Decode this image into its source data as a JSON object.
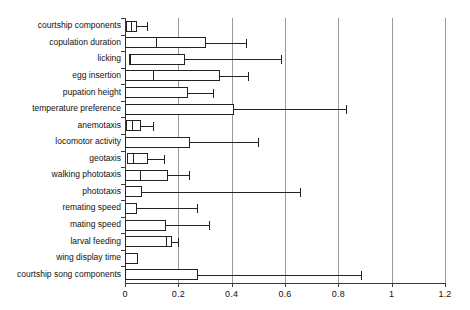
{
  "chart_data": {
    "type": "bar",
    "title": "",
    "subtitle": "",
    "xlabel": "",
    "ylabel": "",
    "xlim": [
      0,
      1.2
    ],
    "grid": true,
    "legend": "none",
    "orientation": "horizontal",
    "plot_style": "box-and-whisker",
    "xticks": [
      0,
      0.2,
      0.4,
      0.6,
      0.8,
      1,
      1.2
    ],
    "xtick_labels": [
      "0",
      "0.2",
      "0.4",
      "0.6",
      "0.8",
      "1",
      "1.2"
    ],
    "categories": [
      "courtship components",
      "copulation duration",
      "licking",
      "egg insertion",
      "pupation height",
      "temperature preference",
      "anemotaxis",
      "locomotor activity",
      "geotaxis",
      "walking phototaxis",
      "phototaxis",
      "remating speed",
      "mating speed",
      "larval feeding",
      "wing display time",
      "courtship song components"
    ],
    "series": [
      {
        "name": "box lower (q1)",
        "values": [
          0.005,
          0.0,
          0.015,
          0.0,
          0.0,
          0.0,
          0.005,
          0.0,
          0.008,
          0.0,
          0.0,
          0.0,
          0.0,
          0.0,
          0.0,
          0.0
        ]
      },
      {
        "name": "median",
        "values": [
          0.022,
          0.115,
          0.018,
          0.105,
          0.0,
          0.0,
          0.028,
          0.0,
          0.03,
          0.055,
          0.0,
          0.0,
          0.0,
          0.155,
          0.0,
          0.0
        ]
      },
      {
        "name": "box upper (q3)",
        "values": [
          0.045,
          0.305,
          0.225,
          0.355,
          0.235,
          0.41,
          0.06,
          0.245,
          0.085,
          0.16,
          0.065,
          0.045,
          0.155,
          0.175,
          0.048,
          0.275
        ]
      },
      {
        "name": "whisker max",
        "values": [
          0.082,
          0.455,
          0.585,
          0.46,
          0.33,
          0.83,
          0.105,
          0.5,
          0.145,
          0.24,
          0.655,
          0.27,
          0.315,
          0.2,
          0.048,
          0.885
        ]
      }
    ],
    "rows": [
      {
        "label": "courtship components",
        "q1": 0.005,
        "median": 0.022,
        "q3": 0.045,
        "whisker": 0.082
      },
      {
        "label": "copulation duration",
        "q1": 0.0,
        "median": 0.115,
        "q3": 0.305,
        "whisker": 0.455
      },
      {
        "label": "licking",
        "q1": 0.015,
        "median": 0.018,
        "q3": 0.225,
        "whisker": 0.585
      },
      {
        "label": "egg insertion",
        "q1": 0.0,
        "median": 0.105,
        "q3": 0.355,
        "whisker": 0.46
      },
      {
        "label": "pupation height",
        "q1": 0.0,
        "median": null,
        "q3": 0.235,
        "whisker": 0.33
      },
      {
        "label": "temperature preference",
        "q1": 0.0,
        "median": null,
        "q3": 0.41,
        "whisker": 0.83
      },
      {
        "label": "anemotaxis",
        "q1": 0.005,
        "median": 0.028,
        "q3": 0.06,
        "whisker": 0.105
      },
      {
        "label": "locomotor activity",
        "q1": 0.0,
        "median": null,
        "q3": 0.245,
        "whisker": 0.5
      },
      {
        "label": "geotaxis",
        "q1": 0.008,
        "median": 0.03,
        "q3": 0.085,
        "whisker": 0.145
      },
      {
        "label": "walking phototaxis",
        "q1": 0.0,
        "median": 0.055,
        "q3": 0.16,
        "whisker": 0.24
      },
      {
        "label": "phototaxis",
        "q1": 0.0,
        "median": null,
        "q3": 0.065,
        "whisker": 0.655
      },
      {
        "label": "remating speed",
        "q1": 0.0,
        "median": null,
        "q3": 0.045,
        "whisker": 0.27
      },
      {
        "label": "mating speed",
        "q1": 0.0,
        "median": null,
        "q3": 0.155,
        "whisker": 0.315
      },
      {
        "label": "larval feeding",
        "q1": 0.0,
        "median": 0.155,
        "q3": 0.175,
        "whisker": 0.2
      },
      {
        "label": "wing display time",
        "q1": 0.0,
        "median": null,
        "q3": 0.048,
        "whisker": 0.048
      },
      {
        "label": "courtship song components",
        "q1": 0.0,
        "median": null,
        "q3": 0.275,
        "whisker": 0.885
      }
    ]
  },
  "colors": {
    "axis": "#3a3a3a",
    "grid": "#9a9a9a",
    "box_fill": "#ffffff",
    "box_stroke": "#222222",
    "text": "#111111",
    "background": "#ffffff"
  }
}
